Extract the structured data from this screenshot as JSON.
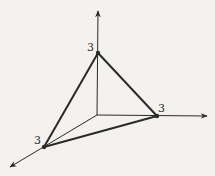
{
  "diagram": {
    "type": "3d-coordinate-axes-plane-triangle",
    "background": "#f4f2ee",
    "stroke_color": "#2a2a2a",
    "origin": [
      97,
      115
    ],
    "axes": [
      {
        "name": "z-axis",
        "direction": "up",
        "tip": [
          98,
          10
        ]
      },
      {
        "name": "y-axis",
        "direction": "right",
        "tip": [
          208,
          116
        ]
      },
      {
        "name": "x-axis",
        "direction": "down-left",
        "tip": [
          9,
          168
        ]
      }
    ],
    "vertices": [
      {
        "name": "z-intercept",
        "point": [
          98,
          53
        ],
        "label": "3",
        "label_pos": [
          88,
          50
        ]
      },
      {
        "name": "y-intercept",
        "point": [
          157,
          116
        ],
        "label": "3",
        "label_pos": [
          159,
          111
        ]
      },
      {
        "name": "x-intercept",
        "point": [
          44,
          147
        ],
        "label": "3",
        "label_pos": [
          34,
          143
        ]
      }
    ],
    "labels": {
      "z_intercept": "3",
      "y_intercept": "3",
      "x_intercept": "3"
    }
  }
}
